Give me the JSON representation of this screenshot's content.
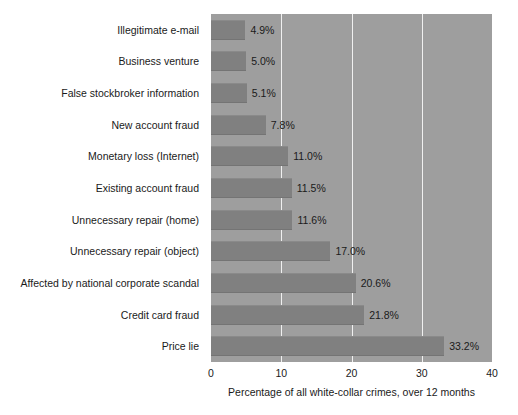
{
  "chart_data": {
    "type": "bar",
    "orientation": "horizontal",
    "title": "",
    "xlabel": "Percentage of all white-collar crimes, over 12 months",
    "ylabel": "",
    "xlim": [
      0,
      40
    ],
    "xticks": [
      "0",
      "10",
      "20",
      "30",
      "40"
    ],
    "xtick_values": [
      0,
      10,
      20,
      30,
      40
    ],
    "grid": true,
    "gridlines_at": [
      10,
      20,
      30
    ],
    "legend": null,
    "categories": [
      "Illegitimate e-mail",
      "Business venture",
      "False stockbroker information",
      "New account fraud",
      "Monetary loss (Internet)",
      "Existing account fraud",
      "Unnecessary repair (home)",
      "Unnecessary repair (object)",
      "Affected by national corporate scandal",
      "Credit card fraud",
      "Price lie"
    ],
    "values": [
      4.9,
      5.0,
      5.1,
      7.8,
      11.0,
      11.5,
      11.6,
      17.0,
      20.6,
      21.8,
      33.2
    ],
    "value_labels": [
      "4.9%",
      "5.0%",
      "5.1%",
      "7.8%",
      "11.0%",
      "11.5%",
      "11.6%",
      "17.0%",
      "20.6%",
      "21.8%",
      "33.2%"
    ],
    "colors": {
      "plot_background": "#9e9e9e",
      "bar_fill": "#808080",
      "gridline": "#f0f0f0",
      "page_background": "#ffffff",
      "text": "#1a1a1a"
    }
  }
}
